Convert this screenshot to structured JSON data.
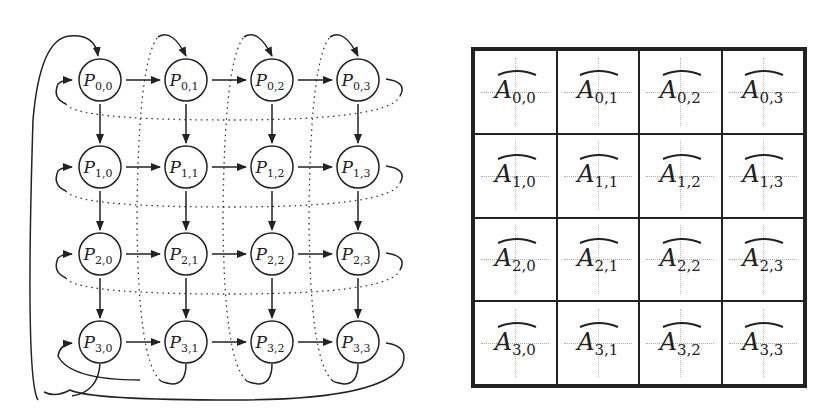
{
  "left_diagram": {
    "title": "2D torus processor grid",
    "nodes": [
      [
        "P",
        "0,0"
      ],
      [
        "P",
        "0,1"
      ],
      [
        "P",
        "0,2"
      ],
      [
        "P",
        "0,3"
      ],
      [
        "P",
        "1,0"
      ],
      [
        "P",
        "1,1"
      ],
      [
        "P",
        "1,2"
      ],
      [
        "P",
        "1,3"
      ],
      [
        "P",
        "2,0"
      ],
      [
        "P",
        "2,1"
      ],
      [
        "P",
        "2,2"
      ],
      [
        "P",
        "2,3"
      ],
      [
        "P",
        "3,0"
      ],
      [
        "P",
        "3,1"
      ],
      [
        "P",
        "3,2"
      ],
      [
        "P",
        "3,3"
      ]
    ],
    "labels": {
      "n00": "0,0",
      "n01": "0,1",
      "n02": "0,2",
      "n03": "0,3",
      "n10": "1,0",
      "n11": "1,1",
      "n12": "1,2",
      "n13": "1,3",
      "n20": "2,0",
      "n21": "2,1",
      "n22": "2,2",
      "n23": "2,3",
      "n30": "3,0",
      "n31": "3,1",
      "n32": "3,2",
      "n33": "3,3"
    },
    "symbol": "P",
    "rows": 4,
    "cols": 4
  },
  "right_matrix": {
    "title": "Block matrix partition",
    "symbol": "A",
    "cells": {
      "c00": "0,0",
      "c01": "0,1",
      "c02": "0,2",
      "c03": "0,3",
      "c10": "1,0",
      "c11": "1,1",
      "c12": "1,2",
      "c13": "1,3",
      "c20": "2,0",
      "c21": "2,1",
      "c22": "2,2",
      "c23": "2,3",
      "c30": "3,0",
      "c31": "3,1",
      "c32": "3,2",
      "c33": "3,3"
    }
  }
}
